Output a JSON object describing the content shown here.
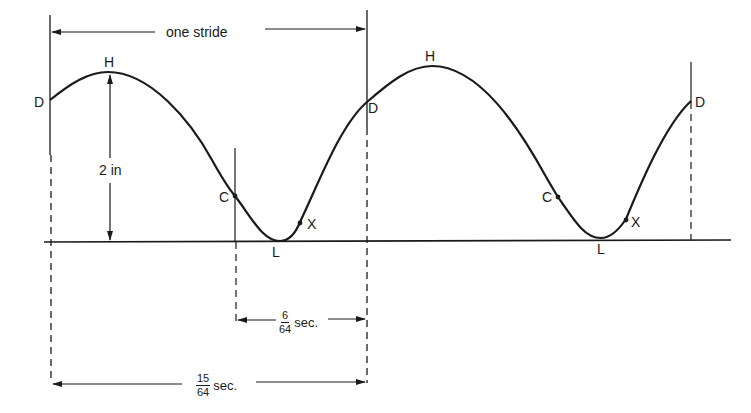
{
  "diagram": {
    "type": "gait-cycle-waveform",
    "stride_label": "one stride",
    "height_label": "2 in",
    "interval_short": {
      "numerator": "6",
      "denominator": "64",
      "unit": "sec."
    },
    "interval_long": {
      "numerator": "15",
      "denominator": "64",
      "unit": "sec."
    },
    "points": [
      {
        "id": "D1",
        "label": "D"
      },
      {
        "id": "H1",
        "label": "H"
      },
      {
        "id": "C1",
        "label": "C"
      },
      {
        "id": "L1",
        "label": "L"
      },
      {
        "id": "X1",
        "label": "X"
      },
      {
        "id": "D2",
        "label": "D"
      },
      {
        "id": "H2",
        "label": "H"
      },
      {
        "id": "C2",
        "label": "C"
      },
      {
        "id": "L2",
        "label": "L"
      },
      {
        "id": "X2",
        "label": "X"
      },
      {
        "id": "D3",
        "label": "D"
      }
    ],
    "colors": {
      "ink": "#1a1a1a",
      "background": "#ffffff"
    }
  }
}
